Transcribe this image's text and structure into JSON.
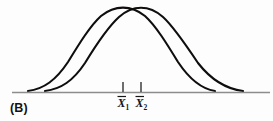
{
  "figure": {
    "panel_label": "(B)",
    "background_color": "#fdfdfd",
    "curve_color": "#100d0d",
    "axis_color": "#8d8d8d",
    "tick_color": "#4a4a4a",
    "label_color": "#161616"
  },
  "axis": {
    "x_start": 12,
    "x_end": 270,
    "y": 92
  },
  "ticks": [
    {
      "name": "tick-xbar1",
      "x": 123,
      "y_top": 82,
      "y_bottom": 92,
      "label_base": "X",
      "label_sub": "1"
    },
    {
      "name": "tick-xbar2",
      "x": 141,
      "y_top": 82,
      "y_bottom": 92,
      "label_base": "X",
      "label_sub": "2"
    }
  ],
  "tick_label_text": {
    "xbar1": "X̄1",
    "xbar2": "X̄2"
  },
  "chart_data": {
    "type": "line",
    "title": "",
    "subtitle": "",
    "xlabel": "",
    "ylabel": "",
    "panel": "(B)",
    "grid": false,
    "legend_position": "none",
    "annotations": [
      {
        "text": "(B)",
        "x": 10,
        "y": 112
      },
      {
        "text": "X̄1",
        "x": 123,
        "y": 106
      },
      {
        "text": "X̄2",
        "x": 141,
        "y": 106
      }
    ],
    "axis_ranges": {
      "xlim": [
        12,
        270
      ],
      "ylim": [
        0,
        92
      ]
    },
    "tick_labels": [
      "X̄1",
      "X̄2"
    ],
    "tick_values": [
      123,
      141
    ],
    "series": [
      {
        "name": "distribution-1",
        "description": "Left normal curve, mean X-bar 1",
        "mean": 123,
        "peak_y_px": 8,
        "baseline_left_x": 28,
        "baseline_right_x": 215,
        "x": [
          28,
          46,
          64,
          82,
          100,
          112,
          123,
          134,
          146,
          164,
          182,
          200,
          215
        ],
        "y": [
          91,
          82,
          66,
          44,
          21,
          12,
          8,
          11,
          19,
          41,
          63,
          81,
          91
        ]
      },
      {
        "name": "distribution-2",
        "description": "Right normal curve, mean X-bar 2",
        "mean": 141,
        "peak_y_px": 8,
        "baseline_left_x": 45,
        "baseline_right_x": 243,
        "x": [
          45,
          63,
          81,
          99,
          117,
          129,
          141,
          153,
          165,
          183,
          201,
          222,
          243
        ],
        "y": [
          91,
          83,
          68,
          47,
          23,
          13,
          8,
          11,
          19,
          41,
          64,
          83,
          91
        ]
      }
    ]
  }
}
